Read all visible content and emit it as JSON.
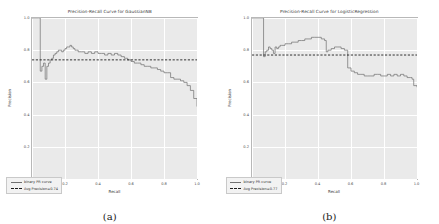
{
  "figure": {
    "panels": [
      {
        "caption": "(a)",
        "title": "Precision-Recall Curve for GaussianNB",
        "xlabel": "Recall",
        "ylabel": "Precision",
        "legend": {
          "curve_label": "binary PR curve",
          "avg_label": "Avg Precision=0.74"
        },
        "chart_data": {
          "type": "line",
          "title": "Precision-Recall Curve for GaussianNB",
          "xlabel": "Recall",
          "ylabel": "Precision",
          "xlim": [
            0.0,
            1.0
          ],
          "ylim": [
            0.0,
            1.0
          ],
          "xticks": [
            "0.0",
            "0.2",
            "0.4",
            "0.6",
            "0.8",
            "1.0"
          ],
          "yticks": [
            "0.0",
            "0.2",
            "0.4",
            "0.6",
            "0.8",
            "1.0"
          ],
          "grid": true,
          "legend_position": "lower left",
          "average_precision": 0.74,
          "series": [
            {
              "name": "binary PR curve",
              "style": "step",
              "color": "#6f6f6f",
              "x": [
                0.0,
                0.04,
                0.05,
                0.06,
                0.07,
                0.08,
                0.09,
                0.1,
                0.11,
                0.12,
                0.13,
                0.14,
                0.15,
                0.16,
                0.17,
                0.18,
                0.19,
                0.2,
                0.21,
                0.22,
                0.23,
                0.24,
                0.25,
                0.26,
                0.27,
                0.28,
                0.3,
                0.32,
                0.34,
                0.36,
                0.38,
                0.4,
                0.42,
                0.44,
                0.46,
                0.48,
                0.5,
                0.52,
                0.54,
                0.56,
                0.58,
                0.6,
                0.62,
                0.64,
                0.66,
                0.68,
                0.7,
                0.72,
                0.74,
                0.76,
                0.78,
                0.8,
                0.82,
                0.84,
                0.86,
                0.88,
                0.9,
                0.92,
                0.94,
                0.96,
                0.98,
                1.0
              ],
              "y": [
                1.0,
                1.0,
                0.67,
                0.7,
                0.72,
                0.62,
                0.7,
                0.72,
                0.74,
                0.75,
                0.77,
                0.78,
                0.79,
                0.8,
                0.8,
                0.79,
                0.8,
                0.81,
                0.82,
                0.82,
                0.83,
                0.82,
                0.81,
                0.8,
                0.8,
                0.79,
                0.79,
                0.78,
                0.79,
                0.78,
                0.79,
                0.78,
                0.78,
                0.77,
                0.78,
                0.77,
                0.78,
                0.77,
                0.76,
                0.75,
                0.74,
                0.73,
                0.72,
                0.72,
                0.71,
                0.7,
                0.7,
                0.69,
                0.69,
                0.68,
                0.67,
                0.66,
                0.66,
                0.63,
                0.62,
                0.62,
                0.61,
                0.6,
                0.58,
                0.55,
                0.5,
                0.45
              ]
            },
            {
              "name": "Avg Precision=0.74",
              "style": "dashed-hline",
              "color": "#1c1c1c",
              "value": 0.74
            }
          ]
        }
      },
      {
        "caption": "(b)",
        "title": "Precision-Recall Curve for LogisticRegression",
        "xlabel": "Recall",
        "ylabel": "Precision",
        "legend": {
          "curve_label": "binary PR curve",
          "avg_label": "Avg Precision=0.77"
        },
        "chart_data": {
          "type": "line",
          "title": "Precision-Recall Curve for LogisticRegression",
          "xlabel": "Recall",
          "ylabel": "Precision",
          "xlim": [
            0.0,
            1.0
          ],
          "ylim": [
            0.0,
            1.0
          ],
          "xticks": [
            "0.0",
            "0.2",
            "0.4",
            "0.6",
            "0.8",
            "1.0"
          ],
          "yticks": [
            "0.0",
            "0.2",
            "0.4",
            "0.6",
            "0.8",
            "1.0"
          ],
          "grid": true,
          "legend_position": "lower left",
          "average_precision": 0.77,
          "series": [
            {
              "name": "binary PR curve",
              "style": "step",
              "color": "#6f6f6f",
              "x": [
                0.0,
                0.06,
                0.07,
                0.08,
                0.09,
                0.1,
                0.11,
                0.12,
                0.13,
                0.14,
                0.15,
                0.16,
                0.17,
                0.18,
                0.2,
                0.22,
                0.24,
                0.26,
                0.28,
                0.3,
                0.32,
                0.34,
                0.36,
                0.38,
                0.4,
                0.42,
                0.44,
                0.45,
                0.46,
                0.48,
                0.5,
                0.52,
                0.54,
                0.56,
                0.58,
                0.6,
                0.62,
                0.64,
                0.66,
                0.68,
                0.7,
                0.72,
                0.74,
                0.76,
                0.78,
                0.8,
                0.82,
                0.84,
                0.86,
                0.88,
                0.9,
                0.92,
                0.94,
                0.96,
                0.97,
                0.98,
                1.0
              ],
              "y": [
                1.0,
                1.0,
                0.76,
                0.79,
                0.8,
                0.82,
                0.81,
                0.8,
                0.78,
                0.82,
                0.81,
                0.82,
                0.83,
                0.83,
                0.84,
                0.84,
                0.85,
                0.85,
                0.86,
                0.86,
                0.87,
                0.87,
                0.88,
                0.88,
                0.88,
                0.87,
                0.86,
                0.79,
                0.8,
                0.81,
                0.82,
                0.82,
                0.81,
                0.8,
                0.69,
                0.67,
                0.66,
                0.65,
                0.65,
                0.64,
                0.64,
                0.64,
                0.65,
                0.65,
                0.64,
                0.64,
                0.65,
                0.64,
                0.65,
                0.64,
                0.65,
                0.64,
                0.63,
                0.63,
                0.62,
                0.58,
                0.57
              ]
            },
            {
              "name": "Avg Precision=0.77",
              "style": "dashed-hline",
              "color": "#1c1c1c",
              "value": 0.77
            }
          ]
        }
      }
    ]
  }
}
